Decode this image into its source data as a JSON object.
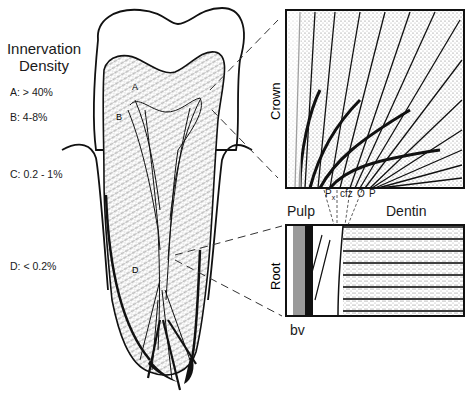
{
  "legend": {
    "title_line1": "Innervation",
    "title_line2": "Density",
    "items": [
      {
        "key": "A",
        "label": "A:  > 40%"
      },
      {
        "key": "B",
        "label": "B:  4-8%"
      },
      {
        "key": "C",
        "label": "C:  0.2 - 1%"
      },
      {
        "key": "D",
        "label": "D:  < 0.2%"
      }
    ]
  },
  "tooth_labels": {
    "A": "A",
    "B": "B",
    "D": "D"
  },
  "insets": {
    "crown": {
      "label": "Crown"
    },
    "root": {
      "label": "Root"
    }
  },
  "zone_labels": {
    "pulp": "Pulp",
    "dentin": "Dentin",
    "px": "P",
    "px_sub": "x",
    "cfz": "cfz",
    "o": "O",
    "p": "P"
  },
  "bv_label": "bv",
  "colors": {
    "ink": "#111111",
    "stipple": "#c8c8c8",
    "paper": "#ffffff",
    "grey_vessel": "#9a9a9a"
  }
}
